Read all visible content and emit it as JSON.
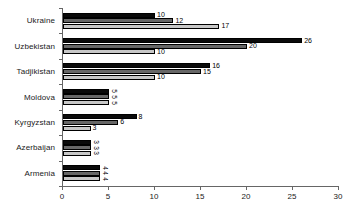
{
  "chart_data": {
    "type": "bar",
    "orientation": "horizontal",
    "title": "",
    "subtitle": "",
    "xlabel": "",
    "ylabel": "",
    "xlim": [
      0,
      30
    ],
    "xticks": [
      0,
      5,
      10,
      15,
      20,
      25,
      30
    ],
    "xtick_labels": [
      "0",
      "5",
      "10",
      "15",
      "20",
      "25",
      "30"
    ],
    "grid": false,
    "legend": "none",
    "categories": [
      "Ukraine",
      "Uzbekistan",
      "Tadjikistan",
      "Moldova",
      "Kyrgyzstan",
      "Azerbaijan",
      "Armenia"
    ],
    "series": [
      {
        "name": "series-1",
        "color": "#0a0a0a",
        "values": [
          10,
          26,
          16,
          5,
          8,
          3,
          4
        ],
        "labels": [
          "10",
          "26",
          "16",
          "5",
          "8",
          "3",
          "4"
        ]
      },
      {
        "name": "series-2",
        "color": "#676767",
        "values": [
          12,
          20,
          15,
          5,
          6,
          3,
          4
        ],
        "labels": [
          "12",
          "20",
          "15",
          "5",
          "6",
          "3",
          "4"
        ]
      },
      {
        "name": "series-3",
        "color": "#c8c8c8",
        "values": [
          17,
          10,
          10,
          5,
          3,
          3,
          4
        ],
        "labels": [
          "17",
          "10",
          "10",
          "5",
          "3",
          "3",
          "4"
        ]
      }
    ],
    "label_orientation_by_category": {
      "Ukraine": "horizontal",
      "Uzbekistan": "horizontal",
      "Tadjikistan": "horizontal",
      "Moldova": "vertical",
      "Kyrgyzstan": "horizontal",
      "Azerbaijan": "vertical",
      "Armenia": "vertical"
    },
    "axis_color": "#666666"
  }
}
